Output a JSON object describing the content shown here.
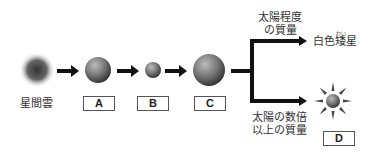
{
  "diagram": {
    "title": "",
    "stages": [
      {
        "id": "nebula",
        "label": "星間雲"
      },
      {
        "id": "A",
        "label": "A"
      },
      {
        "id": "B",
        "label": "B"
      },
      {
        "id": "C",
        "label": "C"
      },
      {
        "id": "D",
        "label": "D"
      }
    ],
    "branches": {
      "upper_condition": [
        "太陽程度",
        "の質量"
      ],
      "upper_result": "白色矮星",
      "upper_result_ruby": "わい",
      "lower_condition": [
        "太陽の数倍",
        "以上の質量"
      ]
    }
  }
}
